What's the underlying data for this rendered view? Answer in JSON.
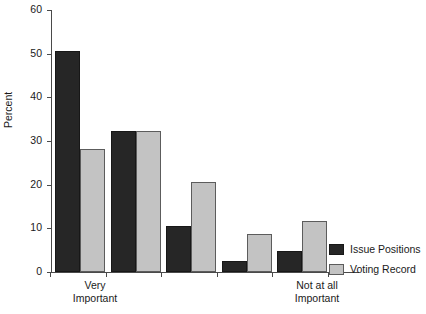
{
  "chart_data": {
    "type": "bar",
    "title": "",
    "subtitle": "",
    "xlabel": "",
    "ylabel": "Percent",
    "ylim": [
      0,
      60
    ],
    "yticks": [
      0,
      10,
      20,
      30,
      40,
      50,
      60
    ],
    "ytick_labels": [
      "0",
      "10",
      "20",
      "30",
      "40",
      "50",
      "60"
    ],
    "grid": false,
    "legend_position": "right-bottom",
    "categories": [
      "Very\nImportant",
      "",
      "",
      "",
      "Not at all\nImportant"
    ],
    "category_labels_visible": [
      true,
      false,
      false,
      false,
      true
    ],
    "series": [
      {
        "name": "Issue Positions",
        "color": "#262626",
        "values": [
          50.7,
          32.3,
          10.5,
          2.5,
          4.9
        ]
      },
      {
        "name": "Voting Record",
        "color": "#c3c3c3",
        "values": [
          28.1,
          32.4,
          20.5,
          8.8,
          11.6
        ]
      }
    ]
  },
  "legend": {
    "items": [
      {
        "label": "Issue Positions",
        "swatch": "dark-swatch"
      },
      {
        "label": "Voting Record",
        "swatch": "light-swatch"
      }
    ]
  },
  "axes": {
    "y_title": "Percent"
  }
}
